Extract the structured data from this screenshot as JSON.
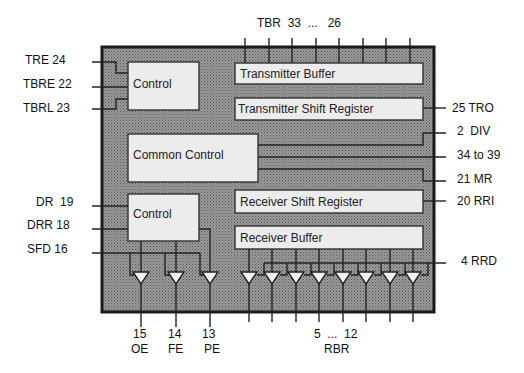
{
  "diagram": {
    "type": "block-diagram",
    "colors": {
      "chip_fill": "#8c8c8c",
      "block_fill": "#ececec",
      "line": "#222222",
      "background": "#ffffff"
    },
    "blocks": {
      "tx_control": "Control",
      "tx_buffer": "Transmitter Buffer",
      "tx_shift": "Transmitter Shift Register",
      "common_control": "Common Control",
      "rx_control": "Control",
      "rx_shift": "Receiver Shift Register",
      "rx_buffer": "Receiver Buffer"
    },
    "left_pins": {
      "tre": "TRE 24",
      "tbre": "TBRE 22",
      "tbrl": "TBRL 23",
      "dr": "DR  19",
      "drr": "DRR 18",
      "sfd": "SFD 16"
    },
    "right_pins": {
      "tro": "25 TRO",
      "div": "2  DIV",
      "range": "34 to 39",
      "mr": "21 MR",
      "rri": "20 RRI",
      "rrd": "4 RRD"
    },
    "top_bus": {
      "label": "TBR  33  ...   26",
      "line_count": 8
    },
    "bottom_pins": {
      "oe_num": "15",
      "oe": "OE",
      "fe_num": "14",
      "fe": "FE",
      "pe_num": "13",
      "pe": "PE",
      "rbr_range": "5  ...  12",
      "rbr": "RBR",
      "rbr_line_count": 8
    }
  }
}
